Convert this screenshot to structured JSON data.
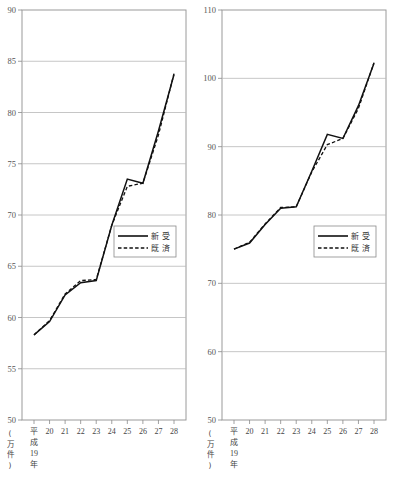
{
  "units_label": "(万件)",
  "era_label": [
    "平",
    "成",
    "19",
    "年"
  ],
  "legend": {
    "series1": "新 受",
    "series2": "既 済"
  },
  "charts": [
    {
      "id": "left",
      "ylim": [
        50,
        90
      ],
      "yticks": [
        "50",
        "55",
        "60",
        "65",
        "70",
        "75",
        "80",
        "85",
        "90"
      ],
      "xticks": [
        "平",
        "20",
        "21",
        "22",
        "23",
        "24",
        "25",
        "26",
        "27",
        "28"
      ]
    },
    {
      "id": "right",
      "ylim": [
        50,
        110
      ],
      "yticks": [
        "50",
        "60",
        "70",
        "80",
        "90",
        "100",
        "110"
      ],
      "xticks": [
        "平",
        "20",
        "21",
        "22",
        "23",
        "24",
        "25",
        "26",
        "27",
        "28"
      ]
    }
  ],
  "chart_data": [
    {
      "type": "line",
      "title": "",
      "xlabel": "(万件)",
      "ylabel": "",
      "ylim": [
        50,
        90
      ],
      "yticks": [
        50,
        55,
        60,
        65,
        70,
        75,
        80,
        85,
        90
      ],
      "grid": true,
      "legend_position": "center-right",
      "categories": [
        "平成19年",
        "20",
        "21",
        "22",
        "23",
        "24",
        "25",
        "26",
        "27",
        "28"
      ],
      "series": [
        {
          "name": "新 受",
          "style": "solid",
          "values": [
            58.3,
            59.6,
            62.2,
            63.4,
            63.6,
            69.0,
            73.5,
            73.1,
            78.2,
            83.7
          ]
        },
        {
          "name": "既 済",
          "style": "dashed",
          "values": [
            58.3,
            59.7,
            62.3,
            63.6,
            63.7,
            69.0,
            72.8,
            73.1,
            77.8,
            83.8
          ]
        }
      ]
    },
    {
      "type": "line",
      "title": "",
      "xlabel": "(万件)",
      "ylabel": "",
      "ylim": [
        50,
        110
      ],
      "yticks": [
        50,
        60,
        70,
        80,
        90,
        100,
        110
      ],
      "grid": true,
      "legend_position": "center-right",
      "categories": [
        "平成19年",
        "20",
        "21",
        "22",
        "23",
        "24",
        "25",
        "26",
        "27",
        "28"
      ],
      "series": [
        {
          "name": "新 受",
          "style": "solid",
          "values": [
            75.0,
            75.9,
            78.6,
            81.0,
            81.2,
            86.4,
            91.8,
            91.2,
            96.0,
            102.2
          ]
        },
        {
          "name": "既 済",
          "style": "dashed",
          "values": [
            75.0,
            76.0,
            78.7,
            81.1,
            81.2,
            86.3,
            90.3,
            91.2,
            95.6,
            102.3
          ]
        }
      ]
    }
  ]
}
